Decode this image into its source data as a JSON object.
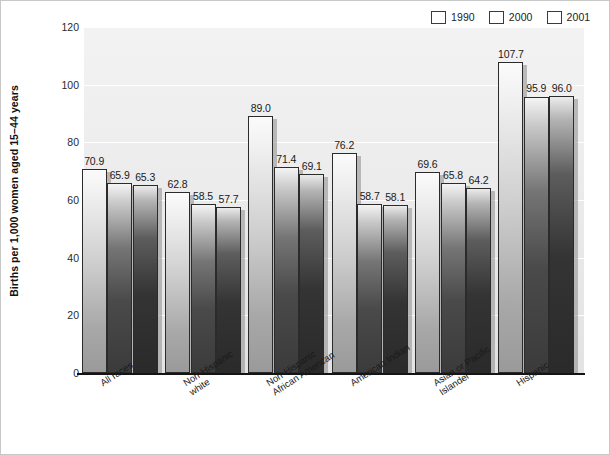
{
  "chart_data": {
    "type": "bar",
    "title": "",
    "xlabel": "",
    "ylabel": "Births per 1,000 women aged 15–44 years",
    "ylim": [
      0,
      120
    ],
    "yticks": [
      0,
      20,
      40,
      60,
      80,
      100,
      120
    ],
    "grid": true,
    "legend_position": "top-right",
    "categories": [
      "All races",
      "Non-Hispanic white",
      "Non-Hispanic African American",
      "American Indian",
      "Asian or Pacific Islander",
      "Hispanic"
    ],
    "category_lines": [
      [
        "All races"
      ],
      [
        "Non-Hispanic",
        "white"
      ],
      [
        "Non-Hispanic",
        "African American"
      ],
      [
        "American Indian"
      ],
      [
        "Asian or Pacific",
        "Islander"
      ],
      [
        "Hispanic"
      ]
    ],
    "series": [
      {
        "name": "1990",
        "color": "#d8d8d8",
        "values": [
          70.9,
          62.8,
          89.0,
          76.2,
          69.6,
          107.7
        ],
        "labels": [
          "70.9",
          "62.8",
          "89.0",
          "76.2",
          "69.6",
          "107.7"
        ]
      },
      {
        "name": "2000",
        "color": "#4a4a4a",
        "values": [
          65.9,
          58.5,
          71.4,
          58.7,
          65.8,
          95.9
        ],
        "labels": [
          "65.9",
          "58.5",
          "71.4",
          "58.7",
          "65.8",
          "95.9"
        ]
      },
      {
        "name": "2001",
        "color": "#2d2d2d",
        "values": [
          65.3,
          57.7,
          69.1,
          58.1,
          64.2,
          96.0
        ],
        "labels": [
          "65.3",
          "57.7",
          "69.1",
          "58.1",
          "64.2",
          "96.0"
        ]
      }
    ]
  },
  "legend": {
    "entries": [
      {
        "label": "1990"
      },
      {
        "label": "2000"
      },
      {
        "label": "2001"
      }
    ]
  },
  "axis": {
    "y_title": "Births per 1,000 women aged 15–44 years",
    "y_tick_labels": [
      "0",
      "20",
      "40",
      "60",
      "80",
      "100",
      "120"
    ]
  }
}
